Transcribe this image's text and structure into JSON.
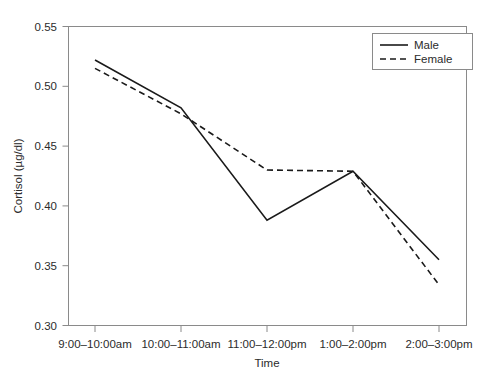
{
  "chart_data": {
    "type": "line",
    "title": "",
    "xlabel": "Time",
    "ylabel": "Cortisol (µg/dl)",
    "categories": [
      "9:00–10:00am",
      "10:00–11:00am",
      "11:00–12:00pm",
      "1:00–2:00pm",
      "2:00–3:00pm"
    ],
    "series": [
      {
        "name": "Male",
        "style": "solid",
        "values": [
          0.522,
          0.482,
          0.388,
          0.429,
          0.355
        ]
      },
      {
        "name": "Female",
        "style": "dashed",
        "values": [
          0.515,
          0.477,
          0.43,
          0.429,
          0.334
        ]
      }
    ],
    "ylim": [
      0.3,
      0.55
    ],
    "yticks": [
      0.3,
      0.35,
      0.4,
      0.45,
      0.5,
      0.55
    ],
    "ytick_labels": [
      "0.30",
      "0.35",
      "0.40",
      "0.45",
      "0.50",
      "0.55"
    ],
    "grid": false,
    "legend_position": "top-right",
    "line_color": "#1a1a1a",
    "axis_color": "#8a8a8a"
  },
  "axes": {
    "y_title": "Cortisol (µg/dl)",
    "x_title": "Time"
  },
  "legend": {
    "entries": [
      {
        "label": "Male"
      },
      {
        "label": "Female"
      }
    ]
  },
  "ticks": {
    "y": [
      "0.55",
      "0.50",
      "0.45",
      "0.40",
      "0.35",
      "0.30"
    ],
    "x": [
      "9:00–10:00am",
      "10:00–11:00am",
      "11:00–12:00pm",
      "1:00–2:00pm",
      "2:00–3:00pm"
    ]
  }
}
